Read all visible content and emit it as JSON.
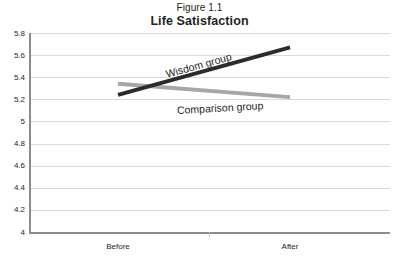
{
  "figure": {
    "number": "Figure 1.1",
    "title": "Life Satisfaction"
  },
  "chart_data": {
    "type": "line",
    "title": "Life Satisfaction",
    "subtitle": "Figure 1.1",
    "xlabel": "",
    "ylabel": "",
    "categories": [
      "Before",
      "After"
    ],
    "x_tick_labels": [
      "Before",
      "After"
    ],
    "y_tick_labels": [
      "4",
      "4.2",
      "4.4",
      "4.6",
      "4.8",
      "5",
      "5.2",
      "5.4",
      "5.6",
      "5.8"
    ],
    "y_ticks": [
      4,
      4.2,
      4.4,
      4.6,
      4.8,
      5,
      5.2,
      5.4,
      5.6,
      5.8
    ],
    "ylim": [
      4,
      5.8
    ],
    "grid": "horizontal",
    "legend_position": "inline-labels",
    "series": [
      {
        "name": "Wisdom group",
        "values": [
          5.24,
          5.67
        ],
        "color": "#2b2b2b",
        "line_width": 4
      },
      {
        "name": "Comparison group",
        "values": [
          5.34,
          5.22
        ],
        "color": "#a6a6a6",
        "line_width": 4
      }
    ],
    "annotations": [
      {
        "text": "Wisdom group",
        "series": "Wisdom group"
      },
      {
        "text": "Comparison group",
        "series": "Comparison group"
      }
    ]
  },
  "axis": {
    "y_labels": [
      "5.8",
      "5.6",
      "5.4",
      "5.2",
      "5",
      "4.8",
      "4.6",
      "4.4",
      "4.2",
      "4"
    ],
    "x_labels": [
      "Before",
      "After"
    ]
  },
  "colors": {
    "wisdom_line": "#2b2b2b",
    "comparison_line": "#a6a6a6",
    "gridline": "#d9d9d9",
    "axis": "#8c8c8c",
    "text": "#231f20",
    "background": "#ffffff"
  }
}
